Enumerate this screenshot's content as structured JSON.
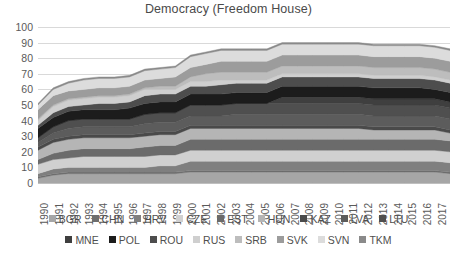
{
  "chart_data": {
    "type": "area",
    "title": "Democracy (Freedom House)",
    "xlabel": "",
    "ylabel": "",
    "ylim": [
      0,
      100
    ],
    "yticks": [
      0,
      10,
      20,
      30,
      40,
      50,
      60,
      70,
      80,
      90,
      100
    ],
    "grid": true,
    "stacked": true,
    "legend_position": "bottom",
    "x": [
      1990,
      1991,
      1992,
      1993,
      1994,
      1995,
      1996,
      1997,
      1998,
      1999,
      2000,
      2001,
      2002,
      2003,
      2004,
      2005,
      2006,
      2007,
      2008,
      2009,
      2010,
      2011,
      2012,
      2013,
      2014,
      2015,
      2016,
      2017
    ],
    "categories": [
      "1990",
      "1991",
      "1992",
      "1993",
      "1994",
      "1995",
      "1996",
      "1997",
      "1998",
      "1999",
      "2000",
      "2001",
      "2002",
      "2003",
      "2004",
      "2005",
      "2006",
      "2007",
      "2008",
      "2009",
      "2010",
      "2011",
      "2012",
      "2013",
      "2014",
      "2015",
      "2016",
      "2017"
    ],
    "series": [
      {
        "name": "BGR",
        "color": "#a6a6a6",
        "values": [
          3,
          5,
          6,
          6,
          6,
          6,
          6,
          6,
          6,
          6,
          7,
          7,
          7,
          7,
          7,
          7,
          7,
          7,
          7,
          7,
          7,
          7,
          7,
          7,
          7,
          7,
          7,
          6
        ]
      },
      {
        "name": "CHN",
        "color": "#6e6e6e",
        "values": [
          1,
          1,
          1,
          1,
          1,
          1,
          1,
          1,
          1,
          1,
          1,
          1,
          1,
          1,
          1,
          1,
          1,
          1,
          1,
          1,
          1,
          1,
          1,
          1,
          1,
          1,
          1,
          1
        ]
      },
      {
        "name": "HRV",
        "color": "#7f7f7f",
        "values": [
          2,
          3,
          3,
          3,
          3,
          3,
          3,
          3,
          4,
          4,
          6,
          6,
          6,
          6,
          6,
          6,
          6,
          6,
          6,
          6,
          6,
          6,
          6,
          6,
          6,
          6,
          6,
          6
        ]
      },
      {
        "name": "CZE",
        "color": "#d0d0d0",
        "values": [
          6,
          6,
          6,
          7,
          7,
          7,
          7,
          7,
          7,
          7,
          7,
          7,
          7,
          7,
          7,
          7,
          7,
          7,
          7,
          7,
          7,
          7,
          7,
          7,
          7,
          7,
          7,
          7
        ]
      },
      {
        "name": "EST",
        "color": "#6b6b6b",
        "values": [
          3,
          4,
          5,
          5,
          5,
          5,
          5,
          6,
          6,
          6,
          7,
          7,
          7,
          7,
          7,
          7,
          7,
          7,
          7,
          7,
          7,
          7,
          7,
          7,
          7,
          7,
          7,
          7
        ]
      },
      {
        "name": "HUN",
        "color": "#b5b5b5",
        "values": [
          6,
          7,
          7,
          7,
          7,
          7,
          7,
          7,
          7,
          7,
          7,
          7,
          7,
          7,
          7,
          7,
          7,
          7,
          7,
          7,
          7,
          7,
          6,
          6,
          6,
          6,
          6,
          5
        ]
      },
      {
        "name": "KAZ",
        "color": "#4a4a4a",
        "values": [
          2,
          2,
          2,
          2,
          2,
          2,
          2,
          2,
          2,
          2,
          2,
          2,
          2,
          2,
          2,
          2,
          2,
          2,
          2,
          2,
          2,
          2,
          2,
          2,
          2,
          2,
          2,
          2
        ]
      },
      {
        "name": "LVA",
        "color": "#5c5c5c",
        "values": [
          3,
          4,
          5,
          5,
          5,
          5,
          5,
          6,
          6,
          6,
          6,
          6,
          6,
          7,
          7,
          7,
          7,
          7,
          7,
          7,
          7,
          7,
          7,
          7,
          7,
          7,
          7,
          7
        ]
      },
      {
        "name": "LTU",
        "color": "#4f4f4f",
        "values": [
          3,
          4,
          5,
          5,
          5,
          5,
          5,
          6,
          6,
          6,
          7,
          7,
          7,
          7,
          7,
          7,
          7,
          7,
          7,
          7,
          7,
          7,
          7,
          7,
          7,
          7,
          7,
          7
        ]
      },
      {
        "name": "MNE",
        "color": "#3f3f3f",
        "values": [
          0,
          0,
          0,
          0,
          0,
          0,
          0,
          0,
          0,
          0,
          0,
          0,
          0,
          0,
          0,
          0,
          4,
          4,
          4,
          4,
          4,
          4,
          4,
          4,
          4,
          4,
          4,
          4
        ]
      },
      {
        "name": "POL",
        "color": "#1c1c1c",
        "values": [
          6,
          6,
          6,
          6,
          6,
          6,
          7,
          7,
          7,
          7,
          7,
          7,
          7,
          7,
          7,
          7,
          7,
          7,
          7,
          7,
          7,
          7,
          7,
          7,
          7,
          7,
          6,
          6
        ]
      },
      {
        "name": "ROU",
        "color": "#4d4d4d",
        "values": [
          2,
          3,
          3,
          3,
          4,
          4,
          4,
          5,
          5,
          5,
          5,
          5,
          6,
          6,
          6,
          6,
          6,
          6,
          6,
          6,
          6,
          6,
          6,
          6,
          6,
          6,
          6,
          6
        ]
      },
      {
        "name": "RUS",
        "color": "#cfcfcf",
        "values": [
          3,
          4,
          4,
          4,
          4,
          4,
          4,
          4,
          3,
          3,
          3,
          3,
          3,
          2,
          2,
          2,
          2,
          2,
          2,
          2,
          2,
          2,
          2,
          2,
          2,
          2,
          2,
          2
        ]
      },
      {
        "name": "SRB",
        "color": "#bdbdbd",
        "values": [
          1,
          1,
          1,
          1,
          1,
          1,
          1,
          1,
          2,
          2,
          3,
          5,
          5,
          5,
          5,
          5,
          5,
          5,
          5,
          5,
          5,
          5,
          5,
          5,
          5,
          5,
          5,
          5
        ]
      },
      {
        "name": "SVK",
        "color": "#9c9c9c",
        "values": [
          6,
          6,
          5,
          5,
          5,
          5,
          5,
          5,
          5,
          6,
          6,
          6,
          7,
          7,
          7,
          7,
          7,
          7,
          7,
          7,
          7,
          7,
          7,
          7,
          7,
          7,
          7,
          7
        ]
      },
      {
        "name": "SVN",
        "color": "#dcdcdc",
        "values": [
          3,
          4,
          5,
          6,
          6,
          6,
          6,
          6,
          6,
          6,
          7,
          7,
          7,
          7,
          7,
          7,
          7,
          7,
          7,
          7,
          7,
          7,
          7,
          7,
          7,
          7,
          7,
          7
        ]
      },
      {
        "name": "TKM",
        "color": "#8a8a8a",
        "values": [
          1,
          1,
          1,
          1,
          1,
          1,
          1,
          1,
          1,
          1,
          1,
          1,
          1,
          1,
          1,
          1,
          1,
          1,
          1,
          1,
          1,
          1,
          1,
          1,
          1,
          1,
          1,
          1
        ]
      }
    ]
  },
  "legend": {
    "rows": [
      [
        "BGR",
        "CHN",
        "HRV",
        "CZE",
        "EST",
        "HUN",
        "KAZ",
        "LVA",
        "LTU"
      ],
      [
        "MNE",
        "POL",
        "ROU",
        "RUS",
        "SRB",
        "SVK",
        "SVN",
        "TKM"
      ]
    ]
  }
}
